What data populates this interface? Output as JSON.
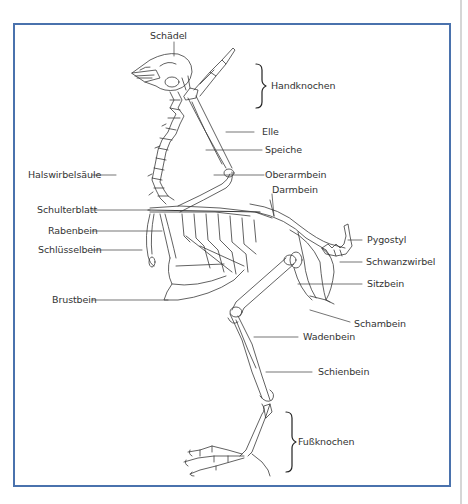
{
  "diagram": {
    "frame_color": "#4a72ad",
    "line_color": "#333333",
    "labels": {
      "skull": "Schädel",
      "hand_bones": "Handknochen",
      "ulna": "Elle",
      "radius": "Speiche",
      "humerus": "Oberarmbein",
      "ilium": "Darmbein",
      "cervical_spine": "Halswirbelsäule",
      "scapula": "Schulterblatt",
      "coracoid": "Rabenbein",
      "clavicle": "Schlüsselbein",
      "pygostyle": "Pygostyl",
      "tail_vertebrae": "Schwanzwirbel",
      "ischium": "Sitzbein",
      "sternum": "Brustbein",
      "pubis": "Schambein",
      "fibula": "Wadenbein",
      "tibia": "Schienbein",
      "foot_bones": "Fußknochen"
    }
  }
}
